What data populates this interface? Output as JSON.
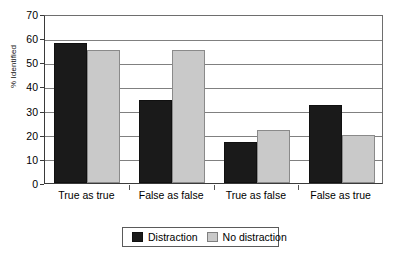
{
  "chart_data": {
    "type": "bar",
    "title": "",
    "xlabel": "",
    "ylabel": "% Identified",
    "categories": [
      "True as true",
      "False as false",
      "True as false",
      "False as true"
    ],
    "series": [
      {
        "name": "Distraction",
        "color": "#1a1a1a",
        "values": [
          58,
          34.5,
          17,
          32.5
        ]
      },
      {
        "name": "No distraction",
        "color": "#c9c9c9",
        "values": [
          55,
          55,
          22,
          20
        ]
      }
    ],
    "ylim": [
      0,
      70
    ],
    "ytick_step": 10,
    "yticks": [
      "70",
      "60",
      "50",
      "40",
      "30",
      "20",
      "10",
      "0"
    ],
    "grid": true,
    "legend_position": "bottom"
  },
  "legend": {
    "entries": [
      {
        "label": "Distraction"
      },
      {
        "label": "No distraction"
      }
    ]
  }
}
